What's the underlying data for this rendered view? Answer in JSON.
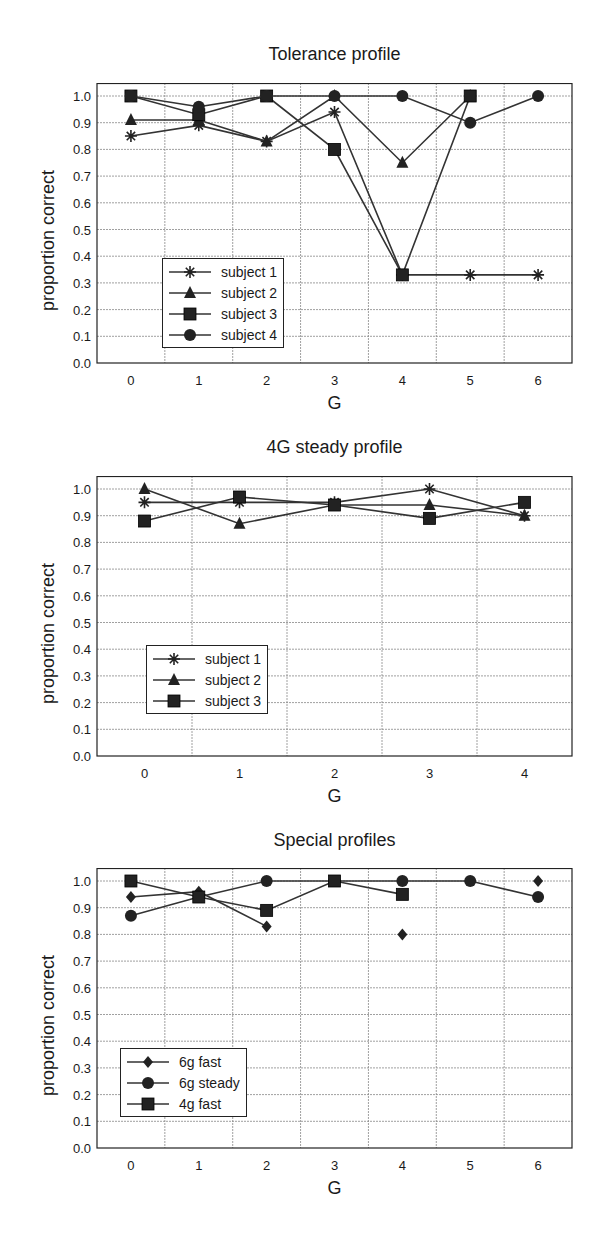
{
  "chart_data": [
    {
      "type": "line",
      "title": "Tolerance profile",
      "xlabel": "G",
      "ylabel": "proportion correct",
      "x": [
        0,
        1,
        2,
        3,
        4,
        5,
        6
      ],
      "xlim": [
        -0.5,
        6.5
      ],
      "ylim": [
        0.0,
        1.0
      ],
      "yticks": [
        "0.0",
        "0.1",
        "0.2",
        "0.3",
        "0.4",
        "0.5",
        "0.6",
        "0.7",
        "0.8",
        "0.9",
        "1.0"
      ],
      "grid": true,
      "legend_position": "lower left",
      "series": [
        {
          "name": "subject 1",
          "marker": "asterisk",
          "values": [
            0.85,
            0.89,
            0.83,
            0.94,
            0.33,
            0.33,
            0.33
          ]
        },
        {
          "name": "subject 2",
          "marker": "triangle",
          "values": [
            0.91,
            0.91,
            0.83,
            1.0,
            0.75,
            1.0,
            null
          ]
        },
        {
          "name": "subject 3",
          "marker": "square",
          "values": [
            1.0,
            0.93,
            1.0,
            0.8,
            0.33,
            1.0,
            null
          ]
        },
        {
          "name": "subject 4",
          "marker": "circle",
          "values": [
            1.0,
            0.96,
            1.0,
            1.0,
            1.0,
            0.9,
            1.0
          ]
        }
      ]
    },
    {
      "type": "line",
      "title": "4G steady profile",
      "xlabel": "G",
      "ylabel": "proportion correct",
      "x": [
        0,
        1,
        2,
        3,
        4
      ],
      "xlim": [
        -0.5,
        4.5
      ],
      "ylim": [
        0.0,
        1.0
      ],
      "yticks": [
        "0.0",
        "0.1",
        "0.2",
        "0.3",
        "0.4",
        "0.5",
        "0.6",
        "0.7",
        "0.8",
        "0.9",
        "1.0"
      ],
      "grid": true,
      "legend_position": "lower left",
      "series": [
        {
          "name": "subject 1",
          "marker": "asterisk",
          "values": [
            0.95,
            0.95,
            0.95,
            1.0,
            0.9
          ]
        },
        {
          "name": "subject 2",
          "marker": "triangle",
          "values": [
            1.0,
            0.87,
            0.94,
            0.94,
            0.9
          ]
        },
        {
          "name": "subject 3",
          "marker": "square",
          "values": [
            0.88,
            0.97,
            0.94,
            0.89,
            0.95
          ]
        }
      ]
    },
    {
      "type": "line",
      "title": "Special profiles",
      "xlabel": "G",
      "ylabel": "proportion correct",
      "x": [
        0,
        1,
        2,
        3,
        4,
        5,
        6
      ],
      "xlim": [
        -0.5,
        6.5
      ],
      "ylim": [
        0.0,
        1.0
      ],
      "yticks": [
        "0.0",
        "0.1",
        "0.2",
        "0.3",
        "0.4",
        "0.5",
        "0.6",
        "0.7",
        "0.8",
        "0.9",
        "1.0"
      ],
      "grid": true,
      "legend_position": "lower left",
      "series": [
        {
          "name": "6g fast",
          "marker": "diamond",
          "values": [
            0.94,
            0.96,
            0.83,
            null,
            0.8,
            null,
            1.0
          ]
        },
        {
          "name": "6g steady",
          "marker": "circle",
          "values": [
            0.87,
            0.94,
            1.0,
            1.0,
            1.0,
            1.0,
            0.94
          ]
        },
        {
          "name": "4g fast",
          "marker": "square",
          "values": [
            1.0,
            0.94,
            0.89,
            1.0,
            0.95,
            null,
            null
          ]
        }
      ]
    }
  ],
  "panels": [
    {
      "top": 83,
      "title_top": 44,
      "legend": {
        "left": 162,
        "top": 258
      }
    },
    {
      "top": 476,
      "title_top": 437,
      "legend": {
        "left": 146,
        "top": 645
      }
    },
    {
      "top": 868,
      "title_top": 830,
      "legend": {
        "left": 120,
        "top": 1048
      }
    }
  ]
}
